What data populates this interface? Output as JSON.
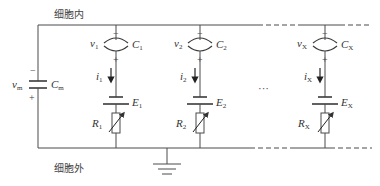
{
  "labels": {
    "inside": "细胞内",
    "outside": "细胞外",
    "ellipsis": "···"
  },
  "membrane": {
    "voltage": "v",
    "voltage_sub": "m",
    "capacitor": "C",
    "capacitor_sub": "m",
    "minus": "−",
    "plus": "+"
  },
  "branches": [
    {
      "v": "v",
      "v_sub": "1",
      "c": "C",
      "c_sub": "1",
      "i": "i",
      "i_sub": "1",
      "e": "E",
      "e_sub": "1",
      "r": "R",
      "r_sub": "1",
      "minus": "−",
      "plus": "+"
    },
    {
      "v": "v",
      "v_sub": "2",
      "c": "C",
      "c_sub": "2",
      "i": "i",
      "i_sub": "2",
      "e": "E",
      "e_sub": "2",
      "r": "R",
      "r_sub": "2",
      "minus": "−",
      "plus": "+"
    },
    {
      "v": "v",
      "v_sub": "X",
      "c": "C",
      "c_sub": "X",
      "i": "i",
      "i_sub": "X",
      "e": "E",
      "e_sub": "X",
      "r": "R",
      "r_sub": "X",
      "minus": "−",
      "plus": "+"
    }
  ],
  "colors": {
    "line": "#4a4a4a",
    "text": "#333333",
    "background": "#ffffff"
  }
}
